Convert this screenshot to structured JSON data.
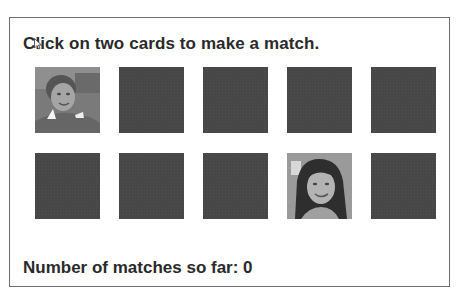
{
  "game": {
    "instruction": "Click on two cards to make a match.",
    "status_label": "Number of matches so far: ",
    "matches": "0"
  },
  "cards": [
    {
      "index": 0,
      "state": "face-up",
      "image": "photo-woman-short-hair"
    },
    {
      "index": 1,
      "state": "face-down"
    },
    {
      "index": 2,
      "state": "face-down"
    },
    {
      "index": 3,
      "state": "face-down"
    },
    {
      "index": 4,
      "state": "face-down"
    },
    {
      "index": 5,
      "state": "face-down"
    },
    {
      "index": 6,
      "state": "face-down"
    },
    {
      "index": 7,
      "state": "face-down"
    },
    {
      "index": 8,
      "state": "face-up",
      "image": "photo-woman-long-hair"
    },
    {
      "index": 9,
      "state": "face-down"
    }
  ],
  "colors": {
    "card_back": "#474747",
    "text": "#2a2a2a",
    "border": "#6e6e6e"
  }
}
